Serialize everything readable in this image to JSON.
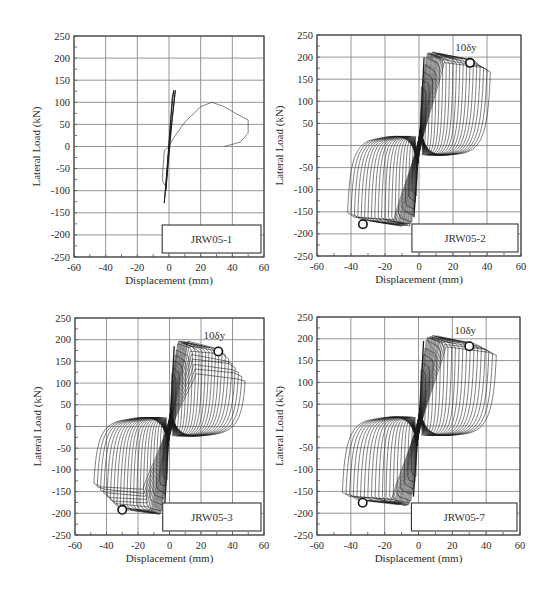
{
  "figure": {
    "x_axis_title": "Displacement (mm)",
    "y_axis_title": "Lateral Load (kN)",
    "marker_annotation": "10δy"
  },
  "chart_data": [
    {
      "type": "line",
      "subtype": "hysteresis",
      "specimen": "JRW05-1",
      "xlabel": "Displacement (mm)",
      "ylabel": "Lateral Load (kN)",
      "xlim": [
        -60,
        60
      ],
      "ylim": [
        -250,
        250
      ],
      "x_ticks": [
        -60,
        -40,
        -20,
        0,
        20,
        40,
        60
      ],
      "y_ticks": [
        250,
        200,
        150,
        100,
        50,
        0,
        -50,
        -100,
        -150,
        -200,
        -250
      ],
      "y_tick_labels": [
        "250",
        "200",
        "150",
        "100",
        "50",
        "0",
        "-50",
        "-100",
        "-150",
        "-200",
        "-250"
      ],
      "grid": true,
      "peak_positive_kN": 127,
      "peak_negative_kN": -128,
      "envelope_curve": {
        "x": [
          0,
          3,
          10,
          20,
          27,
          35,
          42,
          50,
          50,
          45,
          35
        ],
        "y": [
          0,
          20,
          55,
          90,
          100,
          90,
          75,
          60,
          30,
          10,
          0
        ]
      },
      "cycles_summary": "few small elastic cycles up to ~±4 mm, then one large push to ~50 mm with peak ~100 kN at ~27 mm",
      "annotations": []
    },
    {
      "type": "line",
      "subtype": "hysteresis",
      "specimen": "JRW05-2",
      "xlabel": "Displacement (mm)",
      "ylabel": "Lateral Load (kN)",
      "xlim": [
        -60,
        60
      ],
      "ylim": [
        -250,
        250
      ],
      "x_ticks": [
        -60,
        -40,
        -20,
        0,
        20,
        40,
        60
      ],
      "y_ticks": [
        250,
        200,
        150,
        100,
        50,
        0,
        -50,
        -100,
        -150,
        -200,
        -250
      ],
      "y_tick_labels": [
        "250",
        "200",
        "150",
        "100",
        "50",
        "",
        "-50",
        "-100",
        "-150",
        "-200",
        "-250"
      ],
      "grid": true,
      "peak_positive_kN": 210,
      "peak_negative_kN": -180,
      "max_displacement_mm": [
        -42,
        42
      ],
      "num_loops": 20,
      "markers": [
        {
          "x": 30,
          "y": 187,
          "label": "10δy"
        },
        {
          "x": -33,
          "y": -178,
          "label": ""
        }
      ],
      "annotations": [
        "10δy"
      ]
    },
    {
      "type": "line",
      "subtype": "hysteresis",
      "specimen": "JRW05-3",
      "xlabel": "Displacement (mm)",
      "ylabel": "Lateral Load (kN)",
      "xlim": [
        -60,
        60
      ],
      "ylim": [
        -250,
        250
      ],
      "x_ticks": [
        -60,
        -40,
        -20,
        0,
        20,
        40,
        60
      ],
      "y_ticks": [
        250,
        200,
        150,
        100,
        50,
        0,
        -50,
        -100,
        -150,
        -200,
        -250
      ],
      "y_tick_labels": [
        "250",
        "200",
        "150",
        "100",
        "50",
        "0",
        "-50",
        "-100",
        "-150",
        "-200",
        "-250"
      ],
      "grid": true,
      "peak_positive_kN": 195,
      "peak_negative_kN": -200,
      "max_displacement_mm": [
        -48,
        48
      ],
      "num_loops": 22,
      "markers": [
        {
          "x": 31,
          "y": 173,
          "label": "10δy"
        },
        {
          "x": -30,
          "y": -192,
          "label": ""
        }
      ],
      "annotations": [
        "10δy"
      ]
    },
    {
      "type": "line",
      "subtype": "hysteresis",
      "specimen": "JRW05-7",
      "xlabel": "Displacement (mm)",
      "ylabel": "Lateral Load (kN)",
      "xlim": [
        -60,
        60
      ],
      "ylim": [
        -250,
        250
      ],
      "x_ticks": [
        -60,
        -40,
        -20,
        0,
        20,
        40,
        60
      ],
      "y_ticks": [
        250,
        200,
        150,
        100,
        50,
        0,
        -50,
        -100,
        -150,
        -200,
        -250
      ],
      "y_tick_labels": [
        "250",
        "200",
        "150",
        "100",
        "50",
        "",
        "-50",
        "-100",
        "-150",
        "-200",
        "-250"
      ],
      "grid": true,
      "peak_positive_kN": 205,
      "peak_negative_kN": -180,
      "max_displacement_mm": [
        -45,
        46
      ],
      "num_loops": 20,
      "markers": [
        {
          "x": 30,
          "y": 183,
          "label": "10δy"
        },
        {
          "x": -33,
          "y": -176,
          "label": ""
        }
      ],
      "annotations": [
        "10δy"
      ]
    }
  ]
}
